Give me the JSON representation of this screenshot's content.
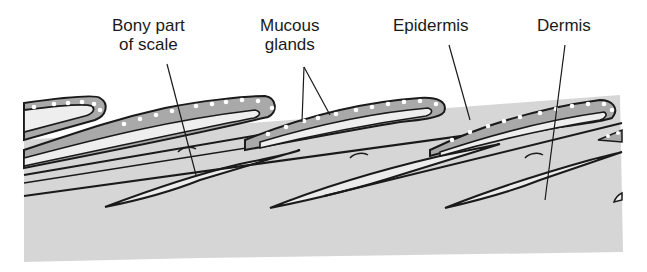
{
  "figure": {
    "labels": [
      {
        "id": "bony-part",
        "lines": [
          "Bony part",
          "of scale"
        ]
      },
      {
        "id": "mucous-glands",
        "lines": [
          "Mucous",
          "glands"
        ]
      },
      {
        "id": "epidermis",
        "lines": [
          "Epidermis"
        ]
      },
      {
        "id": "dermis",
        "lines": [
          "Dermis"
        ]
      }
    ]
  },
  "colors": {
    "background": "#ffffff",
    "dermis_fill": "#d6d6d6",
    "epidermis_fill": "#a9a9a9",
    "scale_fill": "#eeeeee",
    "outline": "#1a1a1a",
    "gland_dots": "#ffffff"
  }
}
